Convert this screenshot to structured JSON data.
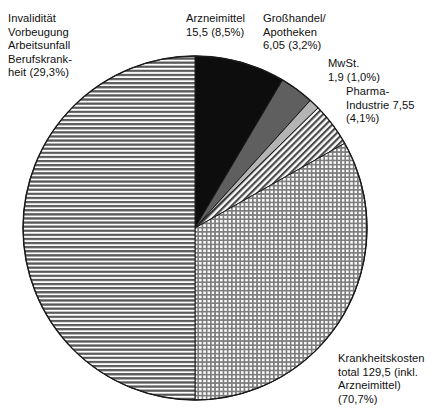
{
  "chart_data": {
    "type": "pie",
    "title": "",
    "subtitle": "",
    "xlabel": "",
    "ylabel": "",
    "legend_position": "none",
    "grid": false,
    "units": "Mrd. (Milliarden)",
    "start_angle_deg": 0,
    "direction": "clockwise",
    "center": {
      "cx": 195,
      "cy": 228,
      "r": 172
    },
    "categories": [
      "Arzneimittel",
      "Großhandel/Apotheken",
      "MwSt.",
      "Pharma-Industrie",
      "Krankheitskosten total (inkl. Arzneimittel)",
      "Invalidität Vorbeugung Arbeitsunfall Berufskrankheit"
    ],
    "values": [
      15.5,
      6.05,
      1.9,
      7.55,
      129.5,
      null
    ],
    "percents": [
      8.5,
      3.2,
      1.0,
      4.1,
      70.7,
      29.3
    ],
    "slices": [
      {
        "name": "arzneimittel",
        "label_lines": [
          "Arzneimittel",
          "15,5 (8,5%)"
        ],
        "value": 15.5,
        "percent": 8.5,
        "fill": "solid-black",
        "color": "#0d0d0d",
        "start_deg": 0,
        "end_deg": 30.6
      },
      {
        "name": "grosshandel-apotheken",
        "label_lines": [
          "Großhandel/",
          "Apotheken",
          "6,05 (3,2%)"
        ],
        "value": 6.05,
        "percent": 3.2,
        "fill": "solid-dark-grey",
        "color": "#5f5f5f",
        "start_deg": 30.6,
        "end_deg": 42.1
      },
      {
        "name": "mwst",
        "label_lines": [
          "MwSt.",
          "1,9 (1,0%)"
        ],
        "value": 1.9,
        "percent": 1.0,
        "fill": "solid-light-grey",
        "color": "#b4b4b4",
        "start_deg": 42.1,
        "end_deg": 45.7
      },
      {
        "name": "pharma-industrie",
        "label_lines": [
          "Pharma-",
          "Industrie 7,55",
          "(4,1%)"
        ],
        "value": 7.55,
        "percent": 4.1,
        "fill": "diagonal-hatch",
        "color": "#6b6b6b",
        "start_deg": 45.7,
        "end_deg": 60.5
      },
      {
        "name": "krankheitskosten",
        "label_lines": [
          "Krankheitskosten",
          "total 129,5 (inkl.",
          "Arzneimittel)",
          "(70,7%)"
        ],
        "value": 129.5,
        "percent": 70.7,
        "fill": "cross-hatch-grid",
        "color": "#8f8f8f",
        "start_deg": 60.5,
        "end_deg": 180.0
      },
      {
        "name": "invaliditaet",
        "label_lines": [
          "Invalidität",
          "Vorbeugung",
          "Arbeitsunfall",
          "Berufskrank-",
          "heit (29,3%)"
        ],
        "value": null,
        "percent": 29.3,
        "fill": "horizontal-stripes",
        "color": "#6e6e6e",
        "start_deg": 180.0,
        "end_deg": 360.0
      }
    ]
  },
  "labels": {
    "invaliditaet": "Invalidität\nVorbeugung\nArbeitsunfall\nBerufskrank-\nheit (29,3%)",
    "arzneimittel": "Arzneimittel\n15,5 (8,5%)",
    "grosshandel": "Großhandel/\nApotheken\n6,05 (3,2%)",
    "mwst": "MwSt.\n1,9 (1,0%)",
    "pharma": "Pharma-\nIndustrie 7,55\n(4,1%)",
    "krankheitskosten": "Krankheitskosten\ntotal 129,5 (inkl.\nArzneimittel)\n(70,7%)"
  },
  "colors": {
    "background": "#ffffff",
    "outline": "#1a1a1a",
    "text": "#101010",
    "arzneimittel": "#0d0d0d",
    "grosshandel": "#5f5f5f",
    "mwst": "#b4b4b4",
    "pharma": "#6b6b6b",
    "krankheitskosten": "#8f8f8f",
    "invaliditaet": "#6e6e6e"
  }
}
